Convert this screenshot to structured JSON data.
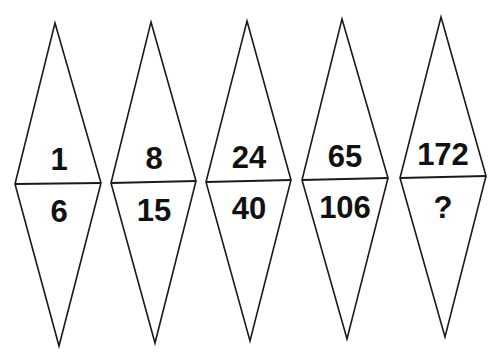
{
  "puzzle": {
    "diamonds": [
      {
        "top": "1",
        "bottom": "6"
      },
      {
        "top": "8",
        "bottom": "15"
      },
      {
        "top": "24",
        "bottom": "40"
      },
      {
        "top": "65",
        "bottom": "106"
      },
      {
        "top": "172",
        "bottom": "?"
      }
    ]
  }
}
